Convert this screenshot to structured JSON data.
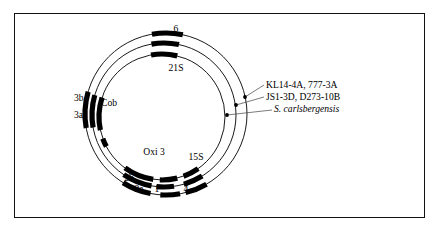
{
  "figure": {
    "kind": "circular-genome-map",
    "border_color": "#111111",
    "line_color": "#000000",
    "segment_fill": "#000000",
    "background": "#ffffff"
  },
  "circles": [
    {
      "id": "outer",
      "strain_label": "KL14-4A, 777-3A",
      "cx": 166,
      "cy": 114,
      "r": 81,
      "italic": false
    },
    {
      "id": "middle",
      "strain_label": "JS1-3D, D273-10B",
      "cx": 164,
      "cy": 115,
      "r": 72,
      "italic": false
    },
    {
      "id": "inner",
      "strain_label": "S. carlsbergensis",
      "cx": 162,
      "cy": 117,
      "r": 63,
      "italic": true
    }
  ],
  "strain_labels": [
    {
      "id": "strain-1",
      "text": "KL14-4A, 777-3A",
      "italic": false,
      "x": 266,
      "y": 88,
      "dot_x": 245,
      "dot_y": 97
    },
    {
      "id": "strain-2",
      "text": "JS1-3D, D273-10B",
      "italic": false,
      "x": 266,
      "y": 100,
      "dot_x": 236,
      "dot_y": 105
    },
    {
      "id": "strain-3",
      "text": "S. carlsbergensis",
      "italic": true,
      "x": 274,
      "y": 112,
      "dot_x": 227,
      "dot_y": 115
    }
  ],
  "gene_labels": [
    {
      "id": "gene-6",
      "text": "6",
      "x": 176,
      "y": 32,
      "anchor": "middle"
    },
    {
      "id": "gene-21S",
      "text": "21S",
      "x": 176,
      "y": 71,
      "anchor": "middle"
    },
    {
      "id": "gene-cob",
      "text": "Cob",
      "x": 101,
      "y": 106,
      "anchor": "start"
    },
    {
      "id": "gene-3b",
      "text": "3b",
      "x": 74,
      "y": 101,
      "anchor": "start"
    },
    {
      "id": "gene-3a",
      "text": "3a",
      "x": 74,
      "y": 118,
      "anchor": "start"
    },
    {
      "id": "gene-oxi3",
      "text": "Oxi 3",
      "x": 154,
      "y": 155,
      "anchor": "middle"
    },
    {
      "id": "gene-15S",
      "text": "15S",
      "x": 196,
      "y": 160,
      "anchor": "middle"
    },
    {
      "id": "gene-2b",
      "text": "2b",
      "x": 129,
      "y": 181,
      "anchor": "middle"
    },
    {
      "id": "gene-2a",
      "text": "2a",
      "x": 139,
      "y": 192,
      "anchor": "middle"
    },
    {
      "id": "gene-1",
      "text": "1",
      "x": 157,
      "y": 192,
      "anchor": "middle"
    },
    {
      "id": "gene-4",
      "text": "4",
      "x": 186,
      "y": 192,
      "anchor": "middle"
    }
  ],
  "segments": {
    "outer": [
      {
        "id": "outer-6",
        "start_deg": -100,
        "end_deg": -78
      },
      {
        "id": "outer-cob",
        "start_deg": 170,
        "end_deg": 196
      },
      {
        "id": "outer-oxi3",
        "start_deg": 101,
        "end_deg": 122
      },
      {
        "id": "outer-15S",
        "start_deg": 60,
        "end_deg": 76
      },
      {
        "id": "outer-4",
        "start_deg": 80,
        "end_deg": 94
      }
    ],
    "middle": [
      {
        "id": "mid-6",
        "start_deg": -100,
        "end_deg": -78
      },
      {
        "id": "mid-cob",
        "start_deg": 170,
        "end_deg": 196
      },
      {
        "id": "mid-oxi3",
        "start_deg": 100,
        "end_deg": 124
      },
      {
        "id": "mid-15S",
        "start_deg": 58,
        "end_deg": 74
      },
      {
        "id": "mid-4",
        "start_deg": 82,
        "end_deg": 96
      }
    ],
    "inner": [
      {
        "id": "in-21S",
        "start_deg": -100,
        "end_deg": -76
      },
      {
        "id": "in-cob",
        "start_deg": 168,
        "end_deg": 198
      },
      {
        "id": "in-3a",
        "start_deg": 152,
        "end_deg": 160
      },
      {
        "id": "in-oxi3",
        "start_deg": 98,
        "end_deg": 126
      },
      {
        "id": "in-1",
        "start_deg": 76,
        "end_deg": 92
      },
      {
        "id": "in-15S",
        "start_deg": 55,
        "end_deg": 70
      }
    ]
  }
}
